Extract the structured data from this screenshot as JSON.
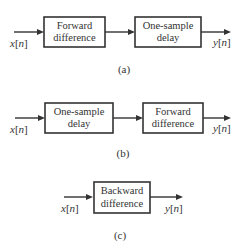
{
  "diagrams": [
    {
      "id": "a",
      "caption": "(a)",
      "input": {
        "var": "x",
        "index": "n"
      },
      "output": {
        "var": "y",
        "index": "n"
      },
      "blocks": [
        {
          "line1": "Forward",
          "line2": "difference"
        },
        {
          "line1": "One-sample",
          "line2": "delay"
        }
      ]
    },
    {
      "id": "b",
      "caption": "(b)",
      "input": {
        "var": "x",
        "index": "n"
      },
      "output": {
        "var": "y",
        "index": "n"
      },
      "blocks": [
        {
          "line1": "One-sample",
          "line2": "delay"
        },
        {
          "line1": "Forward",
          "line2": "difference"
        }
      ]
    },
    {
      "id": "c",
      "caption": "(c)",
      "input": {
        "var": "x",
        "index": "n"
      },
      "output": {
        "var": "y",
        "index": "n"
      },
      "blocks": [
        {
          "line1": "Backward",
          "line2": "difference"
        }
      ]
    }
  ]
}
